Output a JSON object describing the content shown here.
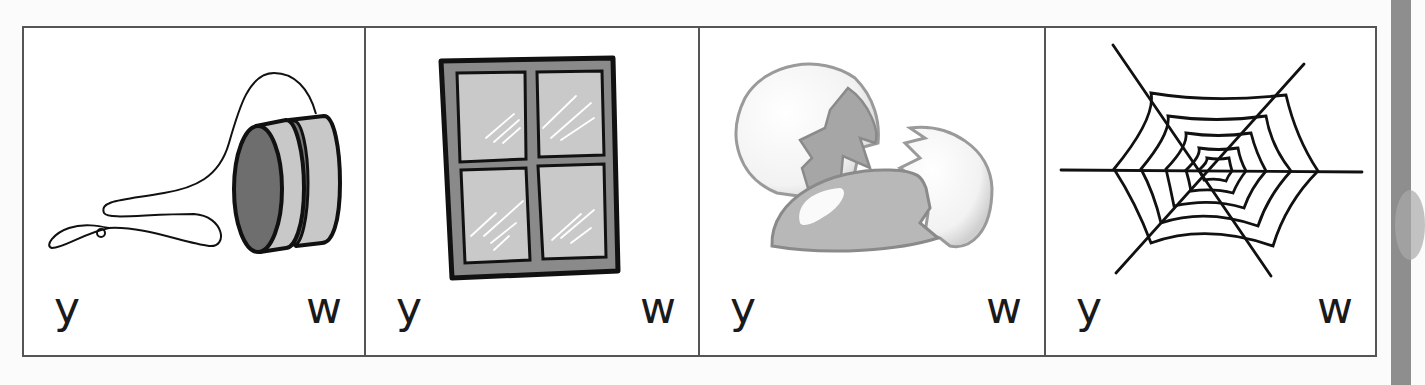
{
  "worksheet": {
    "cards": [
      {
        "picture": "yo-yo",
        "options": [
          "y",
          "w"
        ]
      },
      {
        "picture": "window",
        "options": [
          "y",
          "w"
        ]
      },
      {
        "picture": "cracked-egg-shells",
        "options": [
          "y",
          "w"
        ]
      },
      {
        "picture": "spider-web",
        "options": [
          "y",
          "w"
        ]
      }
    ]
  },
  "colors": {
    "border": "#555555",
    "ink": "#1a1a1a",
    "dark_fill": "#6e6e6e",
    "mid_fill": "#9a9a9a",
    "light_fill": "#c8c8c8",
    "side_strip": "#8e8e8e"
  }
}
